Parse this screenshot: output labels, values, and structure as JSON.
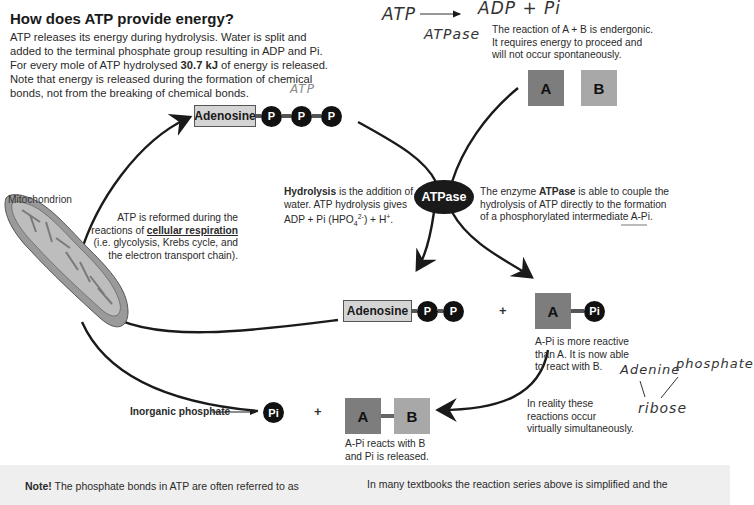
{
  "title": "How does ATP provide energy?",
  "intro": {
    "line1": "ATP releases its energy during hydrolysis. Water is split and",
    "line2": "added to the terminal phosphate group resulting in ADP and Pi.",
    "line3_pre": "For every mole of ATP hydrolysed ",
    "line3_bold": "30.7 kJ",
    "line3_post": " of energy is released.",
    "line4": "Note that energy is released during the formation of chemical",
    "line5": "bonds, not from the breaking of chemical bonds."
  },
  "handwritten": {
    "atp_top": "ATP",
    "equation_left": "ATP",
    "equation_right": "ADP + Pi",
    "enzyme": "ATPase",
    "adenine": "Adenine",
    "phosphate": "phosphate",
    "ribose": "ribose"
  },
  "endergonic_note": {
    "line1": "The reaction of A + B is endergonic.",
    "line2": "It requires energy to proceed and",
    "line3": "will not occur spontaneously."
  },
  "atp_molecule": {
    "adenosine": "Adenosine",
    "phosphates": [
      "P",
      "P",
      "P"
    ]
  },
  "reactants": {
    "a": "A",
    "b": "B"
  },
  "mitochondrion_label": "Mitochondrion",
  "respiration_note": {
    "line1": "ATP is reformed during the",
    "line2_pre": "reactions of ",
    "line2_bold": "cellular respiration",
    "line3": "(i.e. glycolysis, Krebs cycle, and",
    "line4": "the electron transport chain)."
  },
  "hydrolysis_note": {
    "bold": "Hydrolysis",
    "line1_post": " is the addition of",
    "line2": "water. ATP hydrolysis gives",
    "line3_pre": "ADP + Pi (HPO",
    "sub": "4",
    "sup": "2-",
    "line3_mid": ") + H",
    "sup2": "+",
    "line3_post": "."
  },
  "enzyme_label": "ATPase",
  "atpase_note": {
    "line1_pre": "The enzyme ",
    "line1_bold": "ATPase",
    "line1_post": " is able to couple the",
    "line2": "hydrolysis of ATP directly to the formation",
    "line3_pre": "of a phosphorylated intermediate ",
    "line3_underlined": "A-Pi",
    "line3_post": "."
  },
  "adp_molecule": {
    "adenosine": "Adenosine",
    "phosphates": [
      "P",
      "P"
    ]
  },
  "plus": "+",
  "intermediate": {
    "a": "A",
    "pi": "Pi"
  },
  "intermediate_note": {
    "line1": "A-Pi is more reactive",
    "line2": "than A. It is now able",
    "line3": "to react with B."
  },
  "simultaneous_note": {
    "line1": "In reality these",
    "line2": "reactions occur",
    "line3": "virtually simultaneously."
  },
  "inorganic_label": "Inorganic phosphate",
  "pi_ball": "Pi",
  "product": {
    "a": "A",
    "b": "B"
  },
  "product_note": {
    "line1": "A-Pi reacts with B",
    "line2": "and Pi is released."
  },
  "footer": {
    "left_bold": "Note!",
    "left_text": " The phosphate bonds in ATP are often referred to as",
    "right_text": "In many textbooks the reaction series above is simplified and the"
  }
}
